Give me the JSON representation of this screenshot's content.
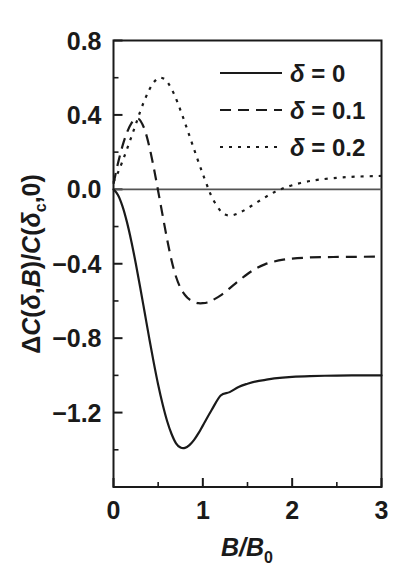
{
  "figure": {
    "background_color": "#ffffff",
    "line_color": "#1a1a1a",
    "frame_color": "#1a1a1a"
  },
  "axes": {
    "y_title_parts": {
      "delta_cap": "Δ",
      "c1": "C",
      "open1": "(",
      "delta1": "δ",
      "comma1": ",",
      "b": "B",
      "close1": ")/",
      "c2": "C",
      "open2": "(",
      "delta2": "δ",
      "sub_c": "c",
      "comma2": ",0",
      "close2": ")"
    },
    "x_title_parts": {
      "b1": "B",
      "slash": "/",
      "b2": "B",
      "sub_0": "0"
    }
  },
  "chart_data": {
    "type": "line",
    "title": "",
    "subtitle": "",
    "xlabel": "B/B_0",
    "ylabel": "ΔC(δ,B)/C(δ_c,0)",
    "xlim": [
      0,
      3
    ],
    "ylim": [
      -1.6,
      0.8
    ],
    "xticks": [
      0,
      1,
      2,
      3
    ],
    "xtick_labels": [
      "0",
      "1",
      "2",
      "3"
    ],
    "yticks": [
      -1.2,
      -0.8,
      -0.4,
      0.0,
      0.4,
      0.8
    ],
    "ytick_labels": [
      "−1.2",
      "−0.8",
      "−0.4",
      "0.0",
      "0.4",
      "0.8"
    ],
    "x_minor_ticks": [
      0.5,
      1.5,
      2.5
    ],
    "y_minor_ticks": [
      -1.4,
      -1.0,
      -0.6,
      -0.2,
      0.2,
      0.6
    ],
    "grid": false,
    "zero_line": true,
    "zero_line_y": 0.0,
    "legend_position": "top-right",
    "series": [
      {
        "name": "δ = 0",
        "style": "solid",
        "dash": "none",
        "points": [
          [
            0.0,
            0.0
          ],
          [
            0.05,
            -0.03
          ],
          [
            0.1,
            -0.09
          ],
          [
            0.15,
            -0.175
          ],
          [
            0.2,
            -0.28
          ],
          [
            0.25,
            -0.4
          ],
          [
            0.3,
            -0.53
          ],
          [
            0.35,
            -0.665
          ],
          [
            0.4,
            -0.8
          ],
          [
            0.45,
            -0.93
          ],
          [
            0.5,
            -1.05
          ],
          [
            0.55,
            -1.155
          ],
          [
            0.6,
            -1.245
          ],
          [
            0.65,
            -1.315
          ],
          [
            0.7,
            -1.365
          ],
          [
            0.75,
            -1.388
          ],
          [
            0.8,
            -1.39
          ],
          [
            0.85,
            -1.375
          ],
          [
            0.9,
            -1.348
          ],
          [
            0.95,
            -1.312
          ],
          [
            1.0,
            -1.27
          ],
          [
            1.1,
            -1.185
          ],
          [
            1.2,
            -1.108
          ],
          [
            1.3,
            -1.09
          ],
          [
            1.4,
            -1.062
          ],
          [
            1.5,
            -1.045
          ],
          [
            1.6,
            -1.032
          ],
          [
            1.7,
            -1.024
          ],
          [
            1.8,
            -1.016
          ],
          [
            2.0,
            -1.008
          ],
          [
            2.2,
            -1.004
          ],
          [
            2.5,
            -1.001
          ],
          [
            2.75,
            -1.0
          ],
          [
            3.0,
            -1.0
          ]
        ]
      },
      {
        "name": "δ = 0.1",
        "style": "dashed",
        "dash": "11,7",
        "points": [
          [
            0.0,
            0.03
          ],
          [
            0.05,
            0.14
          ],
          [
            0.1,
            0.232
          ],
          [
            0.15,
            0.305
          ],
          [
            0.2,
            0.355
          ],
          [
            0.25,
            0.377
          ],
          [
            0.27,
            0.38
          ],
          [
            0.3,
            0.37
          ],
          [
            0.35,
            0.32
          ],
          [
            0.4,
            0.232
          ],
          [
            0.45,
            0.118
          ],
          [
            0.5,
            -0.01
          ],
          [
            0.55,
            -0.14
          ],
          [
            0.6,
            -0.268
          ],
          [
            0.65,
            -0.382
          ],
          [
            0.7,
            -0.47
          ],
          [
            0.75,
            -0.53
          ],
          [
            0.8,
            -0.568
          ],
          [
            0.85,
            -0.592
          ],
          [
            0.9,
            -0.605
          ],
          [
            0.95,
            -0.612
          ],
          [
            1.0,
            -0.612
          ],
          [
            1.05,
            -0.608
          ],
          [
            1.1,
            -0.598
          ],
          [
            1.2,
            -0.57
          ],
          [
            1.3,
            -0.532
          ],
          [
            1.4,
            -0.492
          ],
          [
            1.5,
            -0.455
          ],
          [
            1.6,
            -0.424
          ],
          [
            1.7,
            -0.402
          ],
          [
            1.8,
            -0.388
          ],
          [
            1.9,
            -0.378
          ],
          [
            2.0,
            -0.372
          ],
          [
            2.2,
            -0.366
          ],
          [
            2.4,
            -0.364
          ],
          [
            2.6,
            -0.363
          ],
          [
            3.0,
            -0.362
          ]
        ]
      },
      {
        "name": "δ = 0.2",
        "style": "dotted",
        "dash": "3,6",
        "points": [
          [
            0.0,
            0.04
          ],
          [
            0.05,
            0.09
          ],
          [
            0.1,
            0.15
          ],
          [
            0.15,
            0.215
          ],
          [
            0.2,
            0.282
          ],
          [
            0.25,
            0.35
          ],
          [
            0.3,
            0.42
          ],
          [
            0.35,
            0.482
          ],
          [
            0.4,
            0.535
          ],
          [
            0.45,
            0.575
          ],
          [
            0.5,
            0.597
          ],
          [
            0.53,
            0.6
          ],
          [
            0.58,
            0.59
          ],
          [
            0.62,
            0.565
          ],
          [
            0.68,
            0.51
          ],
          [
            0.75,
            0.425
          ],
          [
            0.82,
            0.33
          ],
          [
            0.9,
            0.218
          ],
          [
            0.98,
            0.108
          ],
          [
            1.05,
            0.018
          ],
          [
            1.1,
            -0.04
          ],
          [
            1.18,
            -0.105
          ],
          [
            1.25,
            -0.135
          ],
          [
            1.32,
            -0.14
          ],
          [
            1.4,
            -0.128
          ],
          [
            1.48,
            -0.108
          ],
          [
            1.58,
            -0.078
          ],
          [
            1.68,
            -0.048
          ],
          [
            1.78,
            -0.02
          ],
          [
            1.88,
            0.002
          ],
          [
            2.0,
            0.022
          ],
          [
            2.15,
            0.04
          ],
          [
            2.3,
            0.052
          ],
          [
            2.5,
            0.062
          ],
          [
            2.7,
            0.068
          ],
          [
            3.0,
            0.072
          ]
        ]
      }
    ]
  },
  "legend": {
    "items": [
      {
        "label": "δ = 0",
        "style": "solid"
      },
      {
        "label": "δ = 0.1",
        "style": "dashed"
      },
      {
        "label": "δ = 0.2",
        "style": "dotted"
      }
    ]
  }
}
